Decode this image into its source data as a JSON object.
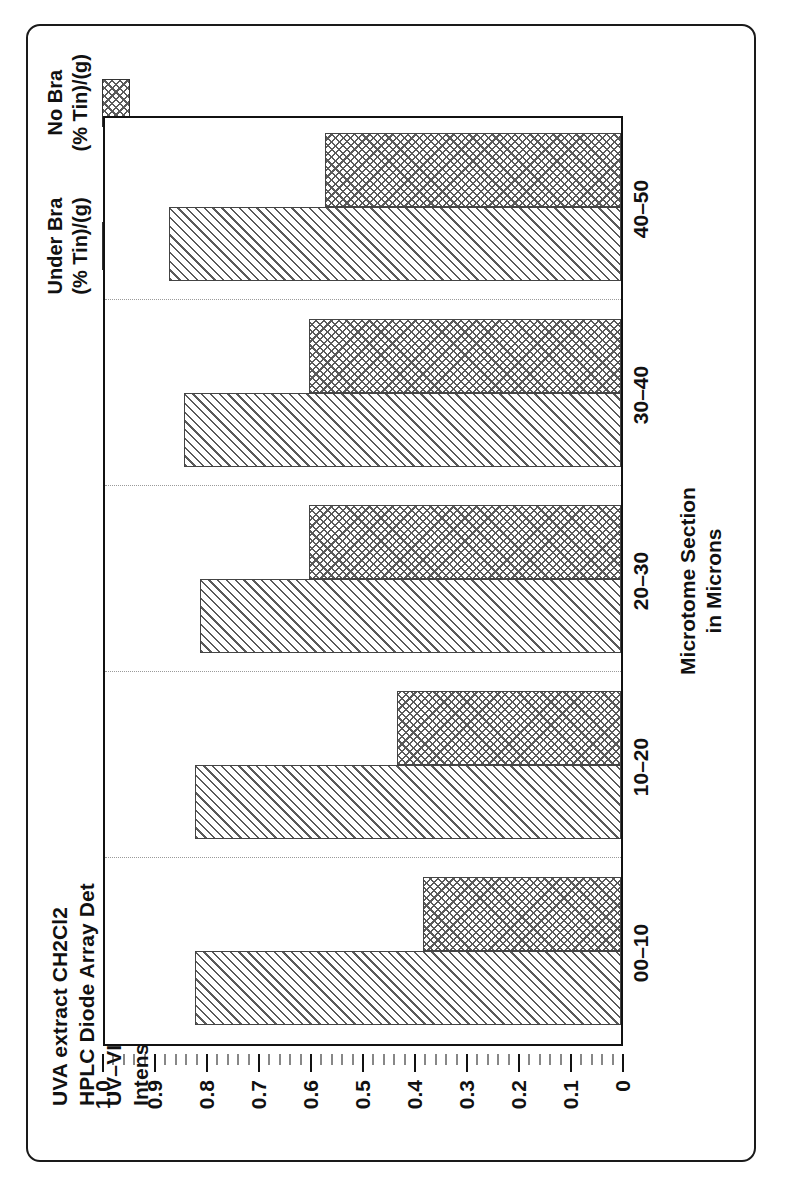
{
  "title": {
    "line1": "UVA extract CH2Cl2",
    "line2": "HPLC Diode Array Det",
    "line3": "UV–VIS Spectrum",
    "line4": "Intensity at 350 nm"
  },
  "legend": {
    "entries": [
      {
        "label_line1": "Under Bra",
        "label_line2": "(% Tin)/(g)",
        "pattern": "diagonal-hatch"
      },
      {
        "label_line1": "No Bra",
        "label_line2": "(% Tin)/(g)",
        "pattern": "cross-hatch"
      }
    ]
  },
  "axes": {
    "value_ticks": [
      "1.0",
      "0.9",
      "0.8",
      "0.7",
      "0.6",
      "0.5",
      "0.4",
      "0.3",
      "0.2",
      "0.1",
      "0"
    ],
    "category_title_line1": "Microtome Section",
    "category_title_line2": "in Microns"
  },
  "colors": {
    "ink": "#111111",
    "hatch": "#5a5a5a",
    "grid": "#9a9a9a",
    "frame": "#1a1a1a"
  },
  "chart_data": {
    "type": "bar",
    "orientation": "horizontal",
    "categories": [
      "00–10",
      "10–20",
      "20–30",
      "30–40",
      "40–50"
    ],
    "series": [
      {
        "name": "Under Bra (% Tin)/(g)",
        "values": [
          0.82,
          0.82,
          0.81,
          0.84,
          0.87
        ],
        "pattern": "diagonal-hatch"
      },
      {
        "name": "No Bra (% Tin)/(g)",
        "values": [
          0.38,
          0.43,
          0.6,
          0.6,
          0.57
        ],
        "pattern": "cross-hatch"
      }
    ],
    "xlabel": "Microtome Section in Microns",
    "ylabel": "(% Tin)/(g)",
    "ylim": [
      0,
      1.0
    ],
    "ytick_step": 0.1,
    "grid": true,
    "legend_position": "top-right"
  }
}
